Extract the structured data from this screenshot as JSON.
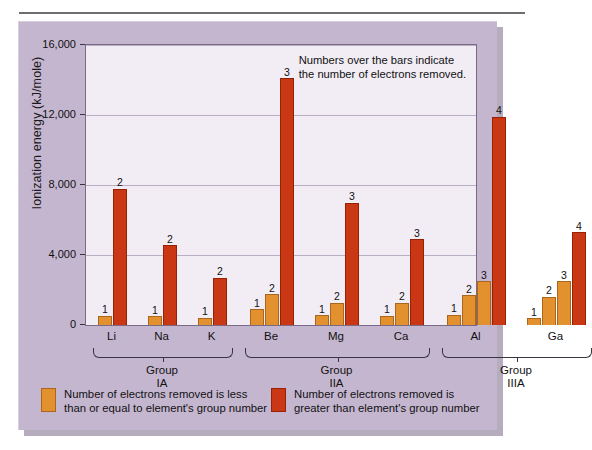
{
  "chart_data": {
    "type": "bar",
    "title": "",
    "xlabel": "",
    "ylabel": "Ionization energy (kJ/mole)",
    "ylim": [
      0,
      16000
    ],
    "yticks": [
      "0",
      "4,000",
      "8,000",
      "12,000",
      "16,000"
    ],
    "ytick_values": [
      0,
      4000,
      8000,
      12000,
      16000
    ],
    "grid": true,
    "legend_position": "below-axes",
    "annotation": "Numbers over the bars indicate\nthe number of electrons removed.",
    "series": [
      {
        "name": "Number of electrons removed is less than or equal to element's group number",
        "color": "#e2912e"
      },
      {
        "name": "Number of electrons removed is greater than element's group number",
        "color": "#c93714"
      }
    ],
    "groups": [
      {
        "group_label": "Group\nIA",
        "elements": [
          {
            "symbol": "Li",
            "bars": [
              {
                "label": "1",
                "value": 520,
                "type": "low"
              },
              {
                "label": "2",
                "value": 7800,
                "type": "high"
              }
            ]
          },
          {
            "symbol": "Na",
            "bars": [
              {
                "label": "1",
                "value": 500,
                "type": "low"
              },
              {
                "label": "2",
                "value": 4560,
                "type": "high"
              }
            ]
          },
          {
            "symbol": "K",
            "bars": [
              {
                "label": "1",
                "value": 420,
                "type": "low"
              },
              {
                "label": "2",
                "value": 2700,
                "type": "high"
              }
            ]
          }
        ]
      },
      {
        "group_label": "Group\nIIA",
        "elements": [
          {
            "symbol": "Be",
            "bars": [
              {
                "label": "1",
                "value": 900,
                "type": "low"
              },
              {
                "label": "2",
                "value": 1760,
                "type": "low"
              },
              {
                "label": "3",
                "value": 14100,
                "type": "high"
              }
            ]
          },
          {
            "symbol": "Mg",
            "bars": [
              {
                "label": "1",
                "value": 560,
                "type": "low"
              },
              {
                "label": "2",
                "value": 1280,
                "type": "low"
              },
              {
                "label": "3",
                "value": 7000,
                "type": "high"
              }
            ]
          },
          {
            "symbol": "Ca",
            "bars": [
              {
                "label": "1",
                "value": 520,
                "type": "low"
              },
              {
                "label": "2",
                "value": 1280,
                "type": "low"
              },
              {
                "label": "3",
                "value": 4900,
                "type": "high"
              }
            ]
          }
        ]
      },
      {
        "group_label": "Group\nIIIA",
        "elements": [
          {
            "symbol": "Al",
            "bars": [
              {
                "label": "1",
                "value": 600,
                "type": "low"
              },
              {
                "label": "2",
                "value": 1700,
                "type": "low"
              },
              {
                "label": "3",
                "value": 2500,
                "type": "low"
              },
              {
                "label": "4",
                "value": 11900,
                "type": "high"
              }
            ]
          },
          {
            "symbol": "Ga",
            "bars": [
              {
                "label": "1",
                "value": 380,
                "type": "low"
              },
              {
                "label": "2",
                "value": 1620,
                "type": "low"
              },
              {
                "label": "3",
                "value": 2500,
                "type": "low"
              },
              {
                "label": "4",
                "value": 5300,
                "type": "high"
              }
            ]
          }
        ]
      }
    ]
  },
  "legend": [
    {
      "swatch": "low",
      "text": "Number of electrons removed is less\nthan or equal to element's group number"
    },
    {
      "swatch": "high",
      "text": "Number of electrons removed is\ngreater than element's group number"
    }
  ],
  "colors": {
    "panel": "#c5b6d0",
    "plot_background": "#f2edf5",
    "bar_low": "#e2912e",
    "bar_high": "#c93714",
    "gridline": "#b9aec4",
    "axis": "#3a3342"
  }
}
